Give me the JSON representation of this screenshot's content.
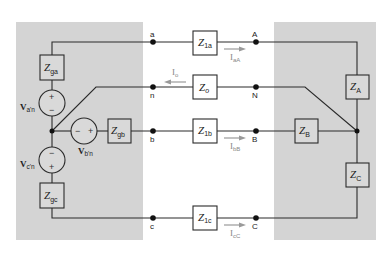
{
  "diagram": {
    "colors": {
      "panel": "#d4d4d4",
      "wire": "#2a2a2a",
      "current_arrow": "#9a9a9a",
      "background": "#ffffff"
    },
    "source": {
      "impedances": [
        {
          "id": "Zga",
          "main": "Z",
          "sub": "ga"
        },
        {
          "id": "Zgb",
          "main": "Z",
          "sub": "gb"
        },
        {
          "id": "Zgc",
          "main": "Z",
          "sub": "gc"
        }
      ],
      "voltages": [
        {
          "id": "va'n",
          "main": "V",
          "sub": "a'n",
          "plus": "+",
          "minus": "−"
        },
        {
          "id": "vb'n",
          "main": "V",
          "sub": "b'n",
          "plus": "+",
          "minus": "−"
        },
        {
          "id": "vc'n",
          "main": "V",
          "sub": "c'n",
          "plus": "+",
          "minus": "−"
        }
      ]
    },
    "lines": {
      "impedances": [
        {
          "id": "Z1a",
          "main": "Z",
          "sub": "1a"
        },
        {
          "id": "Zo",
          "main": "Z",
          "sub": "o"
        },
        {
          "id": "Z1b",
          "main": "Z",
          "sub": "1b"
        },
        {
          "id": "Z1c",
          "main": "Z",
          "sub": "1c"
        }
      ],
      "currents": [
        {
          "id": "IaA",
          "main": "I",
          "sub": "aA"
        },
        {
          "id": "Io",
          "main": "I",
          "sub": "o"
        },
        {
          "id": "IbB",
          "main": "I",
          "sub": "bB"
        },
        {
          "id": "IcC",
          "main": "I",
          "sub": "cC"
        }
      ]
    },
    "nodes": {
      "source_side": [
        "a",
        "n",
        "b",
        "c"
      ],
      "load_side": [
        "A",
        "N",
        "B",
        "C"
      ]
    },
    "load": {
      "impedances": [
        {
          "id": "ZA",
          "main": "Z",
          "sub": "A"
        },
        {
          "id": "ZB",
          "main": "Z",
          "sub": "B"
        },
        {
          "id": "ZC",
          "main": "Z",
          "sub": "C"
        }
      ]
    }
  }
}
